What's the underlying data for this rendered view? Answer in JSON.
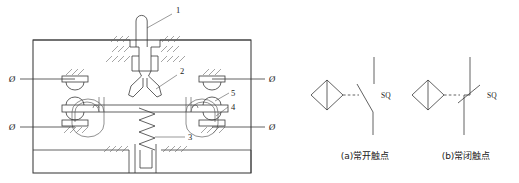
{
  "figure": {
    "title_strip": "          ",
    "kind": "limit-switch-structure-and-symbols"
  },
  "mechanism": {
    "callouts": [
      {
        "id": "1",
        "label": "1"
      },
      {
        "id": "2",
        "label": "2"
      },
      {
        "id": "3",
        "label": "3"
      },
      {
        "id": "4",
        "label": "4"
      },
      {
        "id": "5",
        "label": "5"
      }
    ],
    "terminals": [
      {
        "id": "left-top",
        "label": "Ø"
      },
      {
        "id": "left-bottom",
        "label": "Ø"
      },
      {
        "id": "right-top",
        "label": "Ø"
      },
      {
        "id": "right-bottom",
        "label": "Ø"
      }
    ]
  },
  "symbols": [
    {
      "id": "no-contact",
      "designator": "SQ",
      "caption": "(a)常开触点",
      "state": "normally-open"
    },
    {
      "id": "nc-contact",
      "designator": "SQ",
      "caption": "(b)常闭触点",
      "state": "normally-closed"
    }
  ],
  "colors": {
    "line": "#3a3a3a",
    "thin_line": "#555555",
    "text": "#1a1a1a",
    "background": "#ffffff"
  }
}
